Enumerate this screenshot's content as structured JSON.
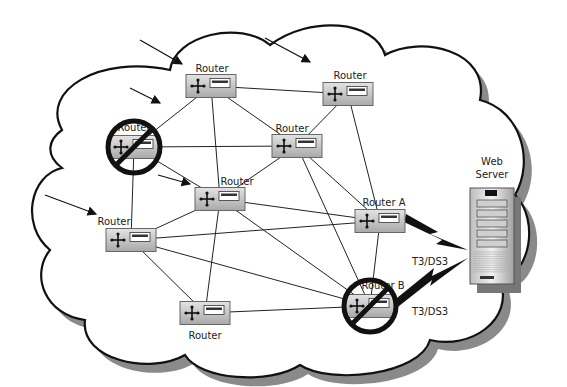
{
  "diagram": {
    "title": "",
    "routers": [
      {
        "id": "r1",
        "label": "Router",
        "failed": false
      },
      {
        "id": "r2",
        "label": "Router",
        "failed": false
      },
      {
        "id": "r3",
        "label": "Router",
        "failed": true
      },
      {
        "id": "r4",
        "label": "Router",
        "failed": false
      },
      {
        "id": "r5",
        "label": "Router",
        "failed": false
      },
      {
        "id": "r6",
        "label": "Router",
        "failed": false
      },
      {
        "id": "ra",
        "label": "Router A",
        "failed": false
      },
      {
        "id": "rb",
        "label": "Router B",
        "failed": true
      },
      {
        "id": "r7",
        "label": "Router",
        "failed": false
      }
    ],
    "links": [
      [
        "r1",
        "r2"
      ],
      [
        "r1",
        "r3"
      ],
      [
        "r1",
        "r4"
      ],
      [
        "r1",
        "r5"
      ],
      [
        "r2",
        "r4"
      ],
      [
        "r2",
        "ra"
      ],
      [
        "r3",
        "r4"
      ],
      [
        "r3",
        "r5"
      ],
      [
        "r3",
        "r6"
      ],
      [
        "r4",
        "r5"
      ],
      [
        "r4",
        "ra"
      ],
      [
        "r4",
        "rb"
      ],
      [
        "r5",
        "r6"
      ],
      [
        "r5",
        "ra"
      ],
      [
        "r5",
        "rb"
      ],
      [
        "r5",
        "r7"
      ],
      [
        "r6",
        "ra"
      ],
      [
        "r6",
        "rb"
      ],
      [
        "r6",
        "r7"
      ],
      [
        "ra",
        "rb"
      ],
      [
        "r7",
        "rb"
      ]
    ],
    "server": {
      "label_line1": "Web",
      "label_line2": "Server"
    },
    "wan_links": [
      {
        "from": "ra",
        "label": "T3/DS3"
      },
      {
        "from": "rb",
        "label": "T3/DS3"
      }
    ],
    "incoming_arrows": 5
  }
}
